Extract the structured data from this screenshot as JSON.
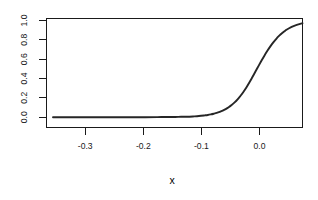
{
  "chart_data": {
    "type": "line",
    "title": "",
    "subtitle": "",
    "xlabel": "x",
    "ylabel": "",
    "xlim": [
      -0.355,
      0.064
    ],
    "ylim": [
      -0.02,
      1.02
    ],
    "grid": false,
    "legend": null,
    "legend_position": "none",
    "x_ticks": [
      -0.3,
      -0.2,
      -0.1,
      0.0
    ],
    "x_tick_labels": [
      "-0.3",
      "-0.2",
      "-0.1",
      "0.0"
    ],
    "y_ticks": [
      0.0,
      0.2,
      0.4,
      0.6,
      0.8,
      1.0
    ],
    "y_tick_labels": [
      "0.0",
      "0.2",
      "0.4",
      "0.6",
      "0.8",
      "1.0"
    ],
    "series": [
      {
        "name": "fitted probability",
        "shape": "logistic sigmoid",
        "color": "#262626",
        "midpoint_x": -0.021,
        "scale": 0.0225,
        "x": [
          -0.355,
          -0.34,
          -0.32,
          -0.3,
          -0.28,
          -0.26,
          -0.24,
          -0.22,
          -0.2,
          -0.18,
          -0.16,
          -0.15,
          -0.14,
          -0.13,
          -0.12,
          -0.11,
          -0.1,
          -0.095,
          -0.09,
          -0.085,
          -0.08,
          -0.075,
          -0.07,
          -0.065,
          -0.06,
          -0.055,
          -0.05,
          -0.045,
          -0.04,
          -0.035,
          -0.03,
          -0.025,
          -0.021,
          -0.015,
          -0.01,
          -0.005,
          0.0,
          0.005,
          0.01,
          0.015,
          0.02,
          0.025,
          0.03,
          0.035,
          0.04,
          0.05,
          0.064
        ],
        "y": [
          0.0,
          0.0,
          0.0,
          0.0,
          0.0,
          0.0,
          0.0,
          0.0,
          0.0,
          0.001,
          0.002,
          0.002,
          0.004,
          0.005,
          0.008,
          0.012,
          0.019,
          0.023,
          0.029,
          0.036,
          0.044,
          0.055,
          0.068,
          0.084,
          0.103,
          0.126,
          0.153,
          0.185,
          0.222,
          0.264,
          0.31,
          0.361,
          0.405,
          0.472,
          0.528,
          0.583,
          0.636,
          0.686,
          0.732,
          0.774,
          0.811,
          0.843,
          0.871,
          0.895,
          0.915,
          0.945,
          0.972
        ]
      }
    ]
  },
  "axis": {
    "x_title": "x",
    "y_title": ""
  }
}
